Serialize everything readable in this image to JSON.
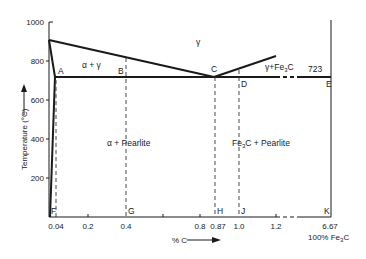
{
  "diagram": {
    "y_axis": {
      "label": "Temperature (°C)",
      "ticks": [
        "1000",
        "800",
        "600",
        "400",
        "200"
      ]
    },
    "x_axis": {
      "label": "% C",
      "ticks": [
        "0.04",
        "0.2",
        "0.4",
        "0.8",
        "0.87",
        "1.0",
        "1.2",
        "6.67"
      ],
      "end_label": "100% Fe",
      "end_label_sub": "3",
      "end_label_tail": "C"
    },
    "regions": {
      "gamma": "γ",
      "alpha_gamma": "α + γ",
      "gamma_fe3c_pre": "γ+Fe",
      "gamma_fe3c_sub": "3",
      "gamma_fe3c_post": "C",
      "alpha_pearlite": "α + Pearlite",
      "fe3c_pearlite_pre": "Fe",
      "fe3c_pearlite_sub": "3",
      "fe3c_pearlite_post": "C + Pearlite"
    },
    "eutectoid_temp": "723",
    "points": {
      "A": "A",
      "B": "B",
      "C": "C",
      "D": "D",
      "E": "E",
      "F": "F",
      "G": "G",
      "H": "H",
      "J": "J",
      "K": "K"
    },
    "colors": {
      "line": "#1a1a1a",
      "dash": "#333333"
    }
  }
}
